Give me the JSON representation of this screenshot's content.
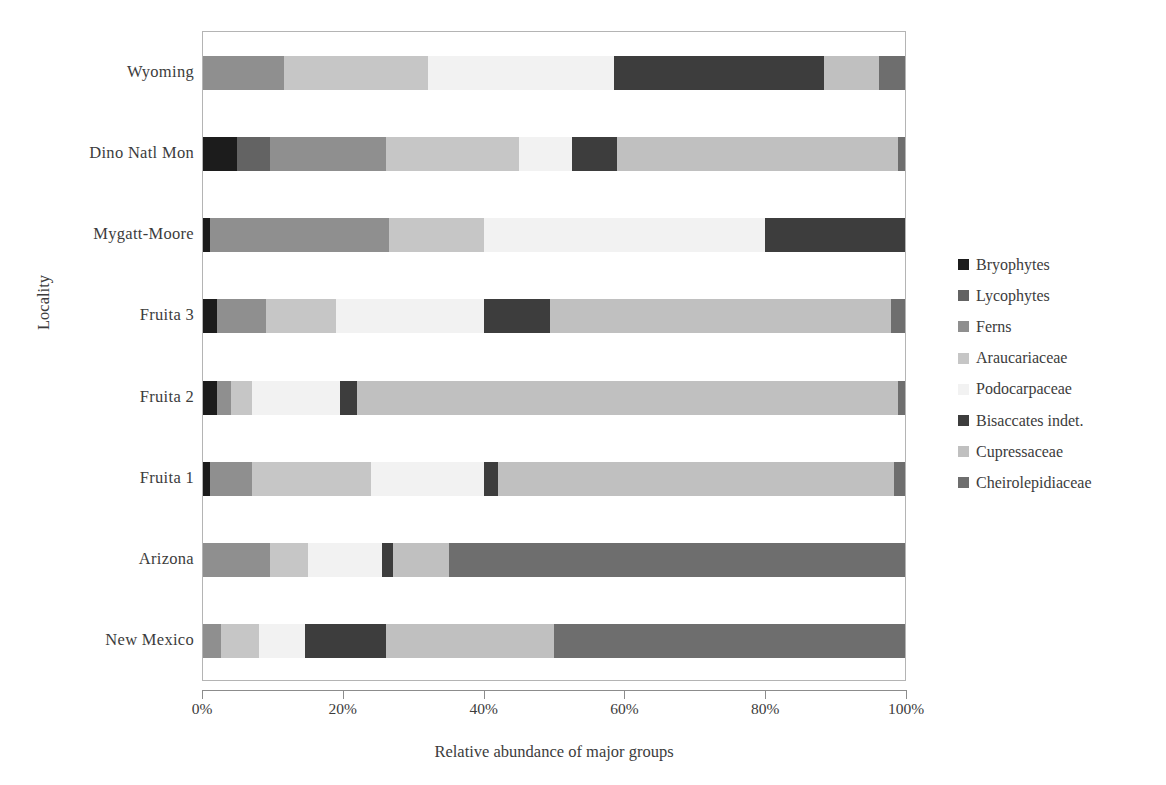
{
  "chart_data": {
    "type": "bar",
    "orientation": "horizontal",
    "stacked": true,
    "normalized": true,
    "title": "",
    "xlabel": "Relative abundance of major groups",
    "ylabel": "Locality",
    "xlim": [
      0,
      100
    ],
    "xticks": [
      0,
      20,
      40,
      60,
      80,
      100
    ],
    "xtick_labels": [
      "0%",
      "20%",
      "40%",
      "60%",
      "80%",
      "100%"
    ],
    "grid": false,
    "legend_position": "right",
    "categories": [
      "Wyoming",
      "Dino Natl Mon",
      "Mygatt-Moore",
      "Fruita 3",
      "Fruita 2",
      "Fruita 1",
      "Arizona",
      "New Mexico"
    ],
    "series": [
      {
        "name": "Bryophytes",
        "color": "#1c1c1c",
        "values": [
          0.0,
          4.8,
          1.0,
          2.0,
          2.0,
          1.0,
          0.0,
          0.0
        ]
      },
      {
        "name": "Lycophytes",
        "color": "#636363",
        "values": [
          0.0,
          4.7,
          0.0,
          0.0,
          0.0,
          0.0,
          0.0,
          0.0
        ]
      },
      {
        "name": "Ferns",
        "color": "#8f8f8f",
        "values": [
          11.5,
          16.5,
          25.5,
          7.0,
          2.0,
          6.0,
          9.5,
          2.5
        ]
      },
      {
        "name": "Araucariaceae",
        "color": "#c6c6c6",
        "values": [
          20.5,
          19.0,
          13.5,
          10.0,
          3.0,
          17.0,
          5.5,
          5.5
        ]
      },
      {
        "name": "Podocarpaceae",
        "color": "#f2f2f2",
        "values": [
          26.5,
          7.5,
          40.0,
          21.0,
          12.5,
          16.0,
          10.5,
          6.5
        ]
      },
      {
        "name": "Bisaccates indet.",
        "color": "#3d3d3d",
        "values": [
          30.0,
          6.5,
          20.0,
          9.5,
          2.5,
          2.0,
          1.5,
          11.5
        ]
      },
      {
        "name": "Cupressaceae",
        "color": "#c0c0c0",
        "values": [
          7.8,
          40.0,
          0.0,
          48.5,
          77.0,
          56.5,
          8.0,
          24.0
        ]
      },
      {
        "name": "Cheirolepidiaceae",
        "color": "#6e6e6e",
        "values": [
          3.7,
          1.0,
          0.0,
          2.0,
          1.0,
          1.5,
          65.0,
          50.0
        ]
      }
    ]
  },
  "legend": {
    "items": [
      {
        "label": "Bryophytes"
      },
      {
        "label": "Lycophytes"
      },
      {
        "label": "Ferns"
      },
      {
        "label": "Araucariaceae"
      },
      {
        "label": "Podocarpaceae"
      },
      {
        "label": "Bisaccates indet."
      },
      {
        "label": "Cupressaceae"
      },
      {
        "label": "Cheirolepidiaceae"
      }
    ]
  },
  "axes": {
    "y_title": "Locality",
    "x_title": "Relative abundance of major groups"
  }
}
